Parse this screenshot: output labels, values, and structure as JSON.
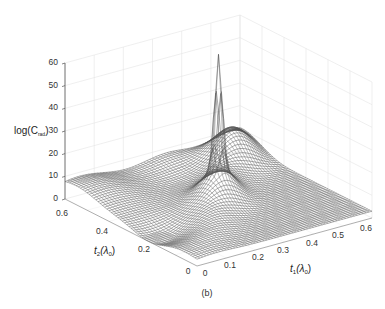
{
  "chart_data": {
    "type": "surface",
    "title": "",
    "caption": "(b)",
    "xlabel": "t₁(λ₀)",
    "ylabel": "t₂(λ₀)",
    "zlabel": "log(Cₙₙ)",
    "x_axis": {
      "name": "t1",
      "range": [
        0,
        0.6
      ],
      "ticks": [
        0,
        0.1,
        0.2,
        0.3,
        0.4,
        0.5,
        0.6
      ]
    },
    "y_axis": {
      "name": "t2",
      "range": [
        0,
        0.6
      ],
      "ticks": [
        0,
        0.2,
        0.4,
        0.6
      ]
    },
    "z_axis": {
      "range": [
        0,
        60
      ],
      "ticks": [
        0,
        10,
        20,
        30,
        40,
        50,
        60
      ]
    },
    "grid": true,
    "render": "wireframe mesh",
    "features": [
      {
        "description": "sharp spike",
        "t1": 0.3,
        "t2": 0.3,
        "z_peak": 57
      },
      {
        "description": "broad ridge along t1≈t2 diagonal",
        "z_approx": 10
      },
      {
        "description": "valley near t2≈0.25, t1≈0",
        "z_approx": 0
      },
      {
        "description": "secondary ridge near t1≈0.45, t2≈0.55",
        "z_approx": 8
      }
    ]
  },
  "labels": {
    "z_axis_label": "log(C",
    "z_axis_sub": "rad",
    "z_axis_close": ")",
    "t2_axis_label": "t",
    "t2_axis_sub": "2",
    "t2_axis_lambda": "(λ",
    "t2_axis_lambda_sub": "0",
    "t2_axis_close": ")",
    "t1_axis_label": "t",
    "t1_axis_sub": "1",
    "t1_axis_lambda": "(λ",
    "t1_axis_lambda_sub": "0",
    "t1_axis_close": ")",
    "caption": "(b)"
  },
  "ticks": {
    "z": [
      "0",
      "10",
      "20",
      "30",
      "40",
      "50",
      "60"
    ],
    "t1": [
      "0",
      "0.1",
      "0.2",
      "0.3",
      "0.4",
      "0.5",
      "0.6"
    ],
    "t2": [
      "0",
      "0.2",
      "0.4",
      "0.6"
    ]
  }
}
